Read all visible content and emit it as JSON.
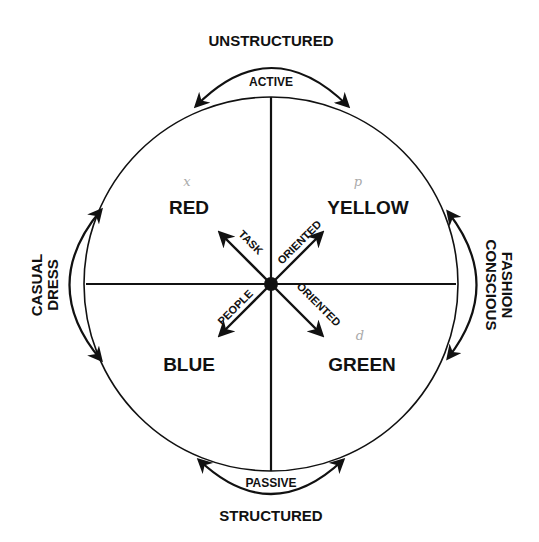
{
  "diagram": {
    "type": "quadrant-circle",
    "colors": {
      "ink": "#111111",
      "background": "#ffffff",
      "pencil": "#aaaaaa"
    },
    "axes": {
      "top": "UNSTRUCTURED",
      "bottom": "STRUCTURED",
      "left": [
        "CASUAL",
        "DRESS"
      ],
      "right": [
        "FASHION",
        "CONSCIOUS"
      ]
    },
    "arcs": {
      "top": "ACTIVE",
      "bottom": "PASSIVE"
    },
    "quadrants": [
      {
        "position": "top-left",
        "label": "RED",
        "annotation": "x"
      },
      {
        "position": "top-right",
        "label": "YELLOW",
        "annotation": "p"
      },
      {
        "position": "bottom-left",
        "label": "BLUE",
        "annotation": ""
      },
      {
        "position": "bottom-right",
        "label": "GREEN",
        "annotation": "d"
      }
    ],
    "diagonals": {
      "up_left": "TASK",
      "up_right": "ORIENTED",
      "down_left": "PEOPLE",
      "down_right": "ORIENTED"
    }
  }
}
